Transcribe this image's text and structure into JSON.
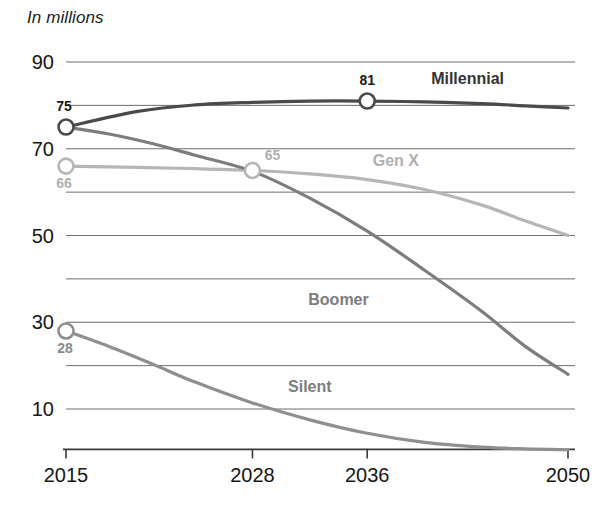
{
  "axis_note": "In millions",
  "chart_data": {
    "type": "line",
    "title": "",
    "subtitle": "",
    "xlabel": "",
    "ylabel": "In millions",
    "x": [
      2015,
      2028,
      2036,
      2050
    ],
    "xtick_labels": [
      "2015",
      "2028",
      "2036",
      "2050"
    ],
    "ytick_labels": [
      "90",
      "70",
      "50",
      "30",
      "10"
    ],
    "ytick_values": [
      90,
      70,
      50,
      30,
      10
    ],
    "gridlines": [
      90,
      80,
      70,
      60,
      50,
      40,
      30,
      20,
      10
    ],
    "grid": true,
    "ylim": [
      0,
      95
    ],
    "xlim": [
      2015,
      2050
    ],
    "legend_position": "inline-labels",
    "series": [
      {
        "name": "Millennial",
        "color": "#4a4a4a",
        "label_color": "#333333",
        "label_x": 2043,
        "label_y": 85,
        "values": [
          75,
          80.2,
          81,
          79.5
        ],
        "points": [
          {
            "x": 2015,
            "y": 75
          },
          {
            "x": 2020,
            "y": 78.6
          },
          {
            "x": 2024,
            "y": 80.1
          },
          {
            "x": 2028,
            "y": 80.7
          },
          {
            "x": 2032,
            "y": 81.0
          },
          {
            "x": 2036,
            "y": 81.0
          },
          {
            "x": 2040,
            "y": 80.8
          },
          {
            "x": 2044,
            "y": 80.4
          },
          {
            "x": 2047,
            "y": 79.9
          },
          {
            "x": 2050,
            "y": 79.4
          }
        ],
        "markers": [
          {
            "x": 2015,
            "y": 75,
            "label": "75",
            "label_dx": -2,
            "label_dy": -16,
            "anchor": "middle",
            "label_color": "#1a1a1a"
          },
          {
            "x": 2036,
            "y": 81,
            "label": "81",
            "label_dx": 0,
            "label_dy": -16,
            "anchor": "middle",
            "label_color": "#1a1a1a"
          }
        ]
      },
      {
        "name": "Gen X",
        "color": "#b6b6b6",
        "label_color": "#b0b0b0",
        "label_x": 2038,
        "label_y": 66,
        "values": [
          66,
          65,
          62.8,
          50
        ],
        "points": [
          {
            "x": 2015,
            "y": 66
          },
          {
            "x": 2020,
            "y": 65.7
          },
          {
            "x": 2024,
            "y": 65.4
          },
          {
            "x": 2028,
            "y": 65.0
          },
          {
            "x": 2032,
            "y": 64.2
          },
          {
            "x": 2036,
            "y": 62.9
          },
          {
            "x": 2040,
            "y": 60.6
          },
          {
            "x": 2044,
            "y": 57.0
          },
          {
            "x": 2047,
            "y": 53.4
          },
          {
            "x": 2050,
            "y": 50.0
          }
        ],
        "markers": [
          {
            "x": 2015,
            "y": 66,
            "label": "66",
            "label_dx": -2,
            "label_dy": 22,
            "anchor": "middle",
            "label_color": "#b0b0b0"
          },
          {
            "x": 2028,
            "y": 65,
            "label": "65",
            "label_dx": 20,
            "label_dy": -10,
            "anchor": "middle",
            "label_color": "#b0b0b0"
          }
        ]
      },
      {
        "name": "Boomer",
        "color": "#7d7d7d",
        "label_color": "#7d7d7d",
        "label_x": 2034,
        "label_y": 34,
        "values": [
          75,
          65,
          51,
          18
        ],
        "points": [
          {
            "x": 2015,
            "y": 75
          },
          {
            "x": 2018,
            "y": 73.4
          },
          {
            "x": 2021,
            "y": 71.2
          },
          {
            "x": 2024,
            "y": 68.5
          },
          {
            "x": 2028,
            "y": 64.8
          },
          {
            "x": 2032,
            "y": 58.6
          },
          {
            "x": 2036,
            "y": 51.0
          },
          {
            "x": 2040,
            "y": 42.0
          },
          {
            "x": 2044,
            "y": 32.5
          },
          {
            "x": 2047,
            "y": 24.5
          },
          {
            "x": 2050,
            "y": 18.0
          }
        ],
        "markers": []
      },
      {
        "name": "Silent",
        "color": "#8f8f8f",
        "label_color": "#7d7d7d",
        "label_x": 2032,
        "label_y": 14,
        "values": [
          28,
          11.5,
          4.2,
          0.6
        ],
        "points": [
          {
            "x": 2015,
            "y": 28
          },
          {
            "x": 2018,
            "y": 24.4
          },
          {
            "x": 2021,
            "y": 20.4
          },
          {
            "x": 2024,
            "y": 16.2
          },
          {
            "x": 2028,
            "y": 11.4
          },
          {
            "x": 2032,
            "y": 7.5
          },
          {
            "x": 2036,
            "y": 4.4
          },
          {
            "x": 2040,
            "y": 2.3
          },
          {
            "x": 2044,
            "y": 1.2
          },
          {
            "x": 2047,
            "y": 0.8
          },
          {
            "x": 2050,
            "y": 0.6
          }
        ],
        "markers": [
          {
            "x": 2015,
            "y": 28,
            "label": "28",
            "label_dx": -1,
            "label_dy": 22,
            "anchor": "middle",
            "label_color": "#8a8a8a"
          }
        ]
      }
    ]
  }
}
